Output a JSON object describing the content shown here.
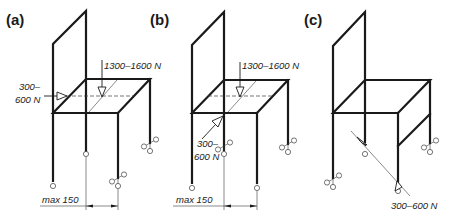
{
  "figure": {
    "panels": [
      {
        "id": "a",
        "label": "(a)",
        "loads": [
          {
            "label": "1300–1600 N",
            "direction": "vertical-down",
            "location": "seat center"
          },
          {
            "label_line1": "300–",
            "label_line2": "600 N",
            "direction": "horizontal",
            "location": "front edge of seat"
          }
        ],
        "dimension": {
          "label": "max 150"
        }
      },
      {
        "id": "b",
        "label": "(b)",
        "loads": [
          {
            "label": "1300–1600 N",
            "direction": "vertical-down",
            "location": "seat center"
          },
          {
            "label_line1": "300–",
            "label_line2": "600 N",
            "direction": "diagonal",
            "location": "front-left corner of seat"
          }
        ],
        "dimension": {
          "label": "max 150"
        }
      },
      {
        "id": "c",
        "label": "(c)",
        "loads": [
          {
            "label": "300–600 N",
            "direction": "diagonal",
            "location": "legs at floor level"
          }
        ]
      }
    ]
  }
}
